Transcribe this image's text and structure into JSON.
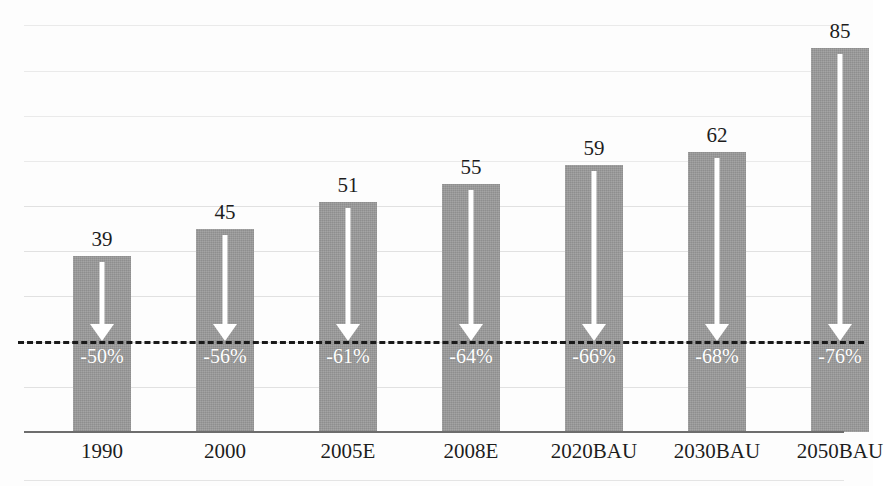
{
  "chart_data": {
    "type": "bar",
    "title": "",
    "subtitle": "",
    "xlabel": "",
    "ylabel": "",
    "ylim": [
      0,
      95
    ],
    "grid": true,
    "legend": null,
    "categories": [
      "1990",
      "2000",
      "2005E",
      "2008E",
      "2020BAU",
      "2030BAU",
      "2050BAU"
    ],
    "values": [
      39,
      45,
      51,
      55,
      59,
      62,
      85
    ],
    "value_labels": [
      "39",
      "45",
      "51",
      "55",
      "59",
      "62",
      "85"
    ],
    "annotations": {
      "reduction_labels": [
        "-50%",
        "-56%",
        "-61%",
        "-64%",
        "-66%",
        "-68%",
        "-76%"
      ],
      "arrow_direction": "down",
      "target_line_value": 19.5,
      "target_line_style": "dashed"
    },
    "colors": {
      "bar": "#9a9a9a",
      "arrow": "#ffffff",
      "target_line": "#1a1a1a",
      "gridline": "#dcdcdc",
      "axis": "#6d6d6d",
      "value_text": "#1d1d1d",
      "pct_text": "#ffffff",
      "background": "#fdfdfd"
    }
  },
  "axis": {
    "gridline_values": [
      10,
      20,
      30,
      40,
      50,
      60,
      70,
      80,
      90
    ]
  }
}
